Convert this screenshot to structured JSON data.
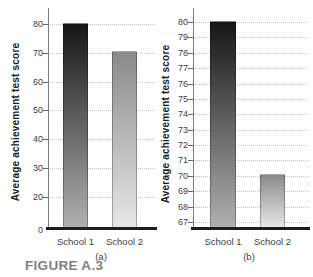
{
  "figure_label": "FIGURE A.3",
  "colors": {
    "background": "#ffffff",
    "grid": "#c3c3c3",
    "axis_line": "#7a7a7a",
    "baseline": "#1d1d1d",
    "tick_label": "#3d3d3d",
    "y_title": "#1c1c1c",
    "figure_label": "#7f7f7f",
    "bar1_top": "#161616",
    "bar1_bottom": "#b0b0b0",
    "bar2_top": "#8a8a8a",
    "bar2_bottom": "#e7e7e7"
  },
  "chart_data": [
    {
      "type": "bar",
      "panel_caption": "(a)",
      "title": "",
      "ylabel": "Average achievement test score",
      "xlabel": "",
      "categories": [
        "School 1",
        "School 2"
      ],
      "values": [
        80,
        70
      ],
      "y_ticks": [
        80,
        70,
        60,
        50,
        40,
        30,
        20
      ],
      "y_baseline_label": "0",
      "ylim": [
        0,
        85
      ],
      "grid": "horizontal-dotted",
      "legend": "none"
    },
    {
      "type": "bar",
      "panel_caption": "(b)",
      "title": "",
      "ylabel": "Average achievement test score",
      "xlabel": "",
      "categories": [
        "School 1",
        "School 2"
      ],
      "values": [
        80,
        70
      ],
      "y_ticks": [
        80,
        79,
        78,
        77,
        76,
        75,
        74,
        73,
        72,
        71,
        70,
        69,
        68,
        67
      ],
      "y_baseline_label": "",
      "ylim": [
        66.5,
        81
      ],
      "grid": "horizontal-dotted",
      "legend": "none"
    }
  ]
}
